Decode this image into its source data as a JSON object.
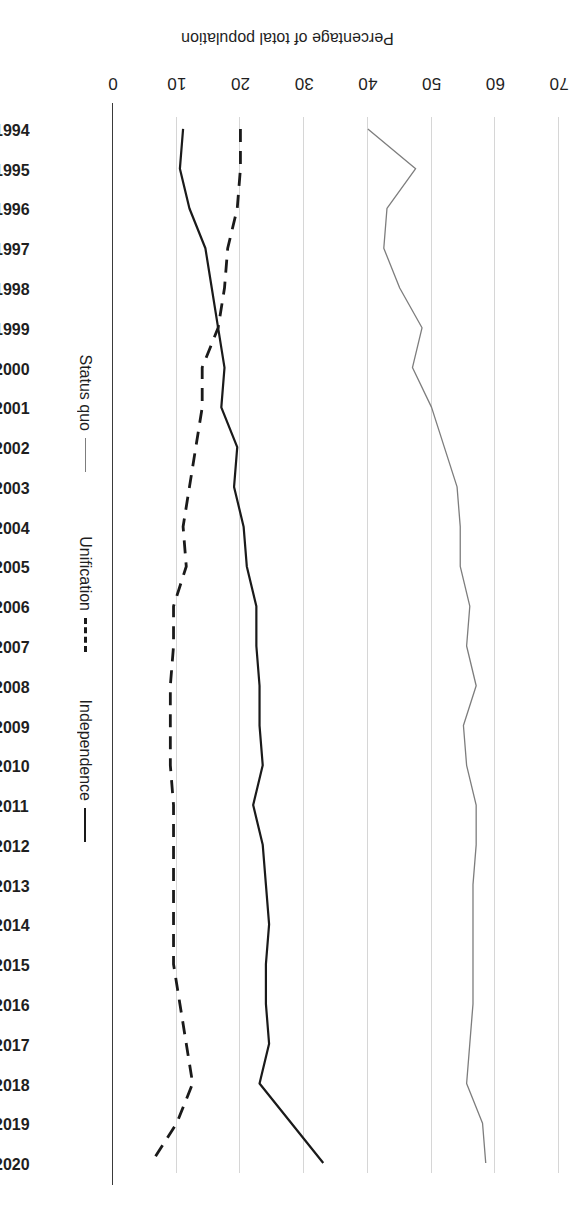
{
  "chart_data": {
    "type": "line",
    "title": "",
    "xlabel": "",
    "ylabel": "Percentage of total population",
    "x": [
      1994,
      1995,
      1996,
      1997,
      1998,
      1999,
      2000,
      2001,
      2002,
      2003,
      2004,
      2005,
      2006,
      2007,
      2008,
      2009,
      2010,
      2011,
      2012,
      2013,
      2014,
      2015,
      2016,
      2017,
      2018,
      2019,
      2020
    ],
    "xtick_labels": [
      "1994",
      "1995",
      "1996",
      "1997",
      "1998",
      "1999",
      "2000",
      "2001",
      "2002",
      "2003",
      "2004",
      "2005",
      "2006",
      "2007",
      "2008",
      "2009",
      "2010",
      "2011",
      "2012",
      "2013",
      "2014",
      "2015",
      "2016",
      "2017",
      "2018",
      "2019",
      "2020"
    ],
    "ytick_labels": [
      "0",
      "10",
      "20",
      "30",
      "40",
      "50",
      "60",
      "70"
    ],
    "yticks": [
      0,
      10,
      20,
      30,
      40,
      50,
      60,
      70
    ],
    "ylim": [
      0,
      70
    ],
    "grid": "value-axis gridlines only",
    "legend_position": "right",
    "orientation": "rotated-180",
    "series": [
      {
        "name": "Independence",
        "style": "solid",
        "color": "#1a1a1a",
        "width": 2.2,
        "values": [
          11.0,
          10.5,
          12.0,
          14.5,
          15.5,
          16.5,
          17.5,
          17.0,
          19.5,
          19.0,
          20.5,
          21.0,
          22.5,
          22.5,
          23.0,
          23.0,
          23.5,
          22.0,
          23.5,
          24.0,
          24.5,
          24.0,
          24.0,
          24.5,
          23.0,
          28.0,
          33.0
        ]
      },
      {
        "name": "Unification",
        "style": "dashed",
        "color": "#1a1a1a",
        "width": 2.8,
        "values": [
          20.0,
          20.0,
          19.5,
          18.0,
          17.5,
          16.5,
          14.0,
          14.0,
          13.0,
          12.0,
          11.0,
          11.5,
          9.5,
          9.5,
          9.0,
          9.0,
          9.0,
          9.5,
          9.5,
          9.5,
          9.5,
          9.5,
          10.5,
          11.5,
          12.5,
          10.0,
          6.0
        ]
      },
      {
        "name": "Status quo",
        "style": "solid-thin",
        "color": "#7d7d7d",
        "width": 1.3,
        "values": [
          40.0,
          47.5,
          43.0,
          42.5,
          45.0,
          48.5,
          47.0,
          50.0,
          52.0,
          54.0,
          54.5,
          54.5,
          56.0,
          55.5,
          57.0,
          55.0,
          55.5,
          57.0,
          57.0,
          56.5,
          56.5,
          56.5,
          56.5,
          56.0,
          55.5,
          58.0,
          58.5
        ]
      }
    ]
  },
  "axis": {
    "value_axis_title": "Percentage of total population"
  },
  "legend": {
    "entries": [
      {
        "label": "Independence",
        "style": "solid",
        "color": "#1a1a1a"
      },
      {
        "label": "Unification",
        "style": "dashed",
        "color": "#1a1a1a"
      },
      {
        "label": "Status quo",
        "style": "thin",
        "color": "#7d7d7d"
      }
    ]
  }
}
